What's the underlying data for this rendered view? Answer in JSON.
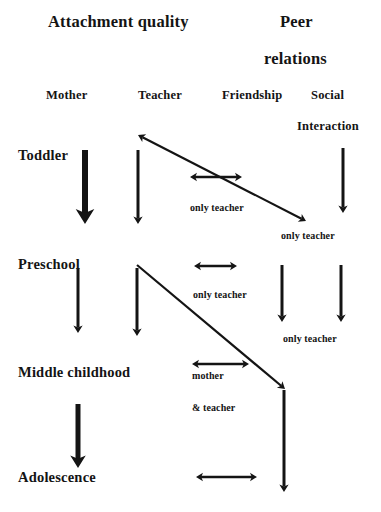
{
  "diagram": {
    "title_groups": [
      {
        "id": "attachment-quality",
        "text": "Attachment quality",
        "x": 48,
        "y": 14
      },
      {
        "id": "peer-relations-line1",
        "text": "Peer",
        "x": 280,
        "y": 14
      },
      {
        "id": "peer-relations-line2",
        "text": "relations",
        "x": 264,
        "y": 51
      }
    ],
    "columns": [
      {
        "id": "mother",
        "label": "Mother",
        "x": 46,
        "y": 89
      },
      {
        "id": "teacher",
        "label": "Teacher",
        "x": 138,
        "y": 89
      },
      {
        "id": "friendship",
        "label": "Friendship",
        "x": 222,
        "y": 89
      },
      {
        "id": "social-line1",
        "label": "Social",
        "x": 311,
        "y": 89
      },
      {
        "id": "social-line2",
        "label": "Interaction",
        "x": 297,
        "y": 120
      }
    ],
    "stages": [
      {
        "id": "toddler",
        "label": "Toddler",
        "x": 18,
        "y": 148
      },
      {
        "id": "preschool",
        "label": "Preschool",
        "x": 18,
        "y": 257
      },
      {
        "id": "middle-childhood",
        "label": "Middle childhood",
        "x": 18,
        "y": 365
      },
      {
        "id": "adolescence",
        "label": "Adolescence",
        "x": 18,
        "y": 470
      }
    ],
    "notes": [
      {
        "id": "note-toddler-teacher-friendship",
        "text": "only teacher",
        "x": 190,
        "y": 203
      },
      {
        "id": "note-toddler-social",
        "text": "only teacher",
        "x": 281,
        "y": 231
      },
      {
        "id": "note-preschool-friendship",
        "text": "only teacher",
        "x": 193,
        "y": 290
      },
      {
        "id": "note-preschool-social",
        "text": "only teacher",
        "x": 283,
        "y": 334
      },
      {
        "id": "note-middle-mother",
        "text": "mother",
        "x": 192,
        "y": 371
      },
      {
        "id": "note-middle-teacher",
        "text": "& teacher",
        "x": 192,
        "y": 403
      }
    ],
    "arrows": {
      "vertical_thick": [
        {
          "id": "mother-toddler-to-preschool",
          "x1": 85,
          "y1": 150,
          "x2": 85,
          "y2": 224,
          "width": 6
        },
        {
          "id": "mother-middle-to-adolescence",
          "x1": 78,
          "y1": 404,
          "x2": 78,
          "y2": 468,
          "width": 5
        }
      ],
      "vertical_thin": [
        {
          "id": "teacher-toddler-to-preschool",
          "x1": 138,
          "y1": 150,
          "x2": 138,
          "y2": 224,
          "width": 3
        },
        {
          "id": "social-toddler-to-preschool",
          "x1": 343,
          "y1": 148,
          "x2": 343,
          "y2": 213,
          "width": 3
        },
        {
          "id": "mother-preschool-to-middle",
          "x1": 78,
          "y1": 268,
          "x2": 78,
          "y2": 333,
          "width": 3
        },
        {
          "id": "teacher-preschool-to-middle",
          "x1": 137,
          "y1": 268,
          "x2": 137,
          "y2": 336,
          "width": 3
        },
        {
          "id": "friendship-preschool-to-middle",
          "x1": 282,
          "y1": 265,
          "x2": 282,
          "y2": 322,
          "width": 3
        },
        {
          "id": "social-preschool-to-middle",
          "x1": 341,
          "y1": 265,
          "x2": 341,
          "y2": 322,
          "width": 3
        },
        {
          "id": "friendship-middle-to-adolescence",
          "x1": 284,
          "y1": 390,
          "x2": 284,
          "y2": 492,
          "width": 3
        }
      ],
      "diagonals": [
        {
          "id": "toddler-teacher-to-social-diagonal",
          "x1": 138,
          "y1": 135,
          "x2": 306,
          "y2": 221,
          "double": true
        },
        {
          "id": "preschool-teacher-to-friendship-diagonal",
          "x1": 137,
          "y1": 265,
          "x2": 285,
          "y2": 389,
          "double": false
        }
      ],
      "horizontal_double": [
        {
          "id": "toddler-friendship-link",
          "x1": 190,
          "y1": 177,
          "x2": 242,
          "y2": 177
        },
        {
          "id": "preschool-friendship-link",
          "x1": 194,
          "y1": 266,
          "x2": 237,
          "y2": 266
        },
        {
          "id": "middle-friendship-link",
          "x1": 192,
          "y1": 364,
          "x2": 249,
          "y2": 364
        },
        {
          "id": "adolescence-friendship-link",
          "x1": 196,
          "y1": 477,
          "x2": 257,
          "y2": 477
        }
      ]
    },
    "colors": {
      "ink": "#141414",
      "background": "#ffffff"
    }
  }
}
